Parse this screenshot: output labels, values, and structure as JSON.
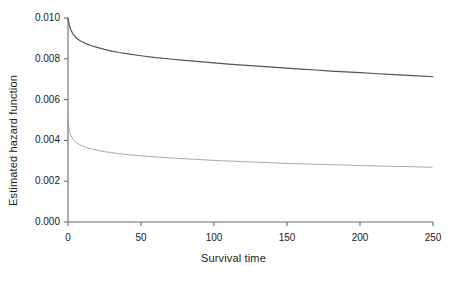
{
  "chart_data": {
    "type": "line",
    "title": "",
    "xlabel": "Survival time",
    "ylabel": "Estimated hazard function",
    "xlim": [
      0,
      250
    ],
    "ylim": [
      0.0,
      0.01
    ],
    "xticks": [
      0,
      50,
      100,
      150,
      200,
      250
    ],
    "xtick_labels": [
      "0",
      "50",
      "100",
      "150",
      "200",
      "250"
    ],
    "yticks": [
      0.0,
      0.002,
      0.004,
      0.006,
      0.008,
      0.01
    ],
    "ytick_labels": [
      "0.000",
      "0.002",
      "0.004",
      "0.006",
      "0.008",
      "0.010"
    ],
    "grid": false,
    "legend": null,
    "series": [
      {
        "name": "upper-hazard-curve",
        "style": "solid",
        "color": "#555555",
        "x": [
          0,
          1,
          2,
          3,
          4,
          5,
          6,
          8,
          10,
          13,
          16,
          20,
          25,
          30,
          35,
          40,
          50,
          60,
          70,
          80,
          90,
          100,
          110,
          120,
          130,
          140,
          150,
          160,
          170,
          180,
          190,
          200,
          210,
          220,
          230,
          240,
          250
        ],
        "y": [
          0.01,
          0.00962,
          0.00941,
          0.00927,
          0.00916,
          0.00908,
          0.00901,
          0.0089,
          0.00882,
          0.00872,
          0.00864,
          0.00856,
          0.00846,
          0.00838,
          0.00831,
          0.00825,
          0.00815,
          0.00806,
          0.00799,
          0.00792,
          0.00786,
          0.0078,
          0.00774,
          0.00769,
          0.00764,
          0.00759,
          0.00754,
          0.00749,
          0.00745,
          0.0074,
          0.00736,
          0.00732,
          0.00728,
          0.00724,
          0.0072,
          0.00716,
          0.00712
        ]
      },
      {
        "name": "lower-hazard-curve",
        "style": "dotted",
        "color": "#8c8c8c",
        "x": [
          0,
          0.5,
          1,
          1.5,
          2,
          3,
          4,
          5,
          6,
          8,
          10,
          13,
          16,
          20,
          25,
          30,
          35,
          40,
          50,
          60,
          70,
          80,
          90,
          100,
          110,
          120,
          130,
          140,
          150,
          160,
          170,
          180,
          190,
          200,
          210,
          220,
          230,
          240,
          250
        ],
        "y": [
          0.005,
          0.00468,
          0.00448,
          0.00434,
          0.00424,
          0.0041,
          0.004,
          0.00393,
          0.00387,
          0.00378,
          0.00372,
          0.00364,
          0.00358,
          0.00352,
          0.00345,
          0.0034,
          0.00335,
          0.00331,
          0.00324,
          0.00319,
          0.00314,
          0.0031,
          0.00306,
          0.00302,
          0.00299,
          0.00296,
          0.00293,
          0.0029,
          0.00287,
          0.00285,
          0.00283,
          0.00281,
          0.00279,
          0.00277,
          0.00275,
          0.00273,
          0.00272,
          0.0027,
          0.00268
        ]
      }
    ]
  },
  "axes": {
    "x_title": "Survival time",
    "y_title": "Estimated hazard function"
  }
}
